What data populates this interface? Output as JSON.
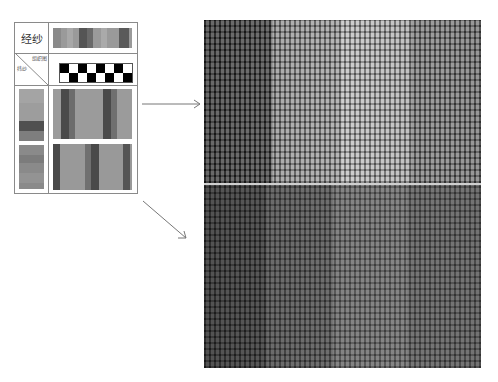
{
  "table": {
    "warp_label": "经纱",
    "weave_label": "组织图",
    "weft_label": "纬纱",
    "weave_pattern": {
      "columns": 8,
      "rows": 2,
      "row_1_black_columns": [
        0,
        2,
        4,
        6
      ],
      "row_2_black_columns": [
        1,
        3,
        5,
        7
      ]
    }
  },
  "colors": {
    "border": "#8a8a8a",
    "weave_black": "#000000",
    "arrow": "#777777",
    "divider": "#cfcfcf"
  },
  "panels": {
    "top": {
      "description": "woven fabric close-up, four vertical stripes: dark, medium, light, medium"
    },
    "bottom": {
      "description": "woven fabric close-up, four vertical stripes in darker tones"
    }
  }
}
